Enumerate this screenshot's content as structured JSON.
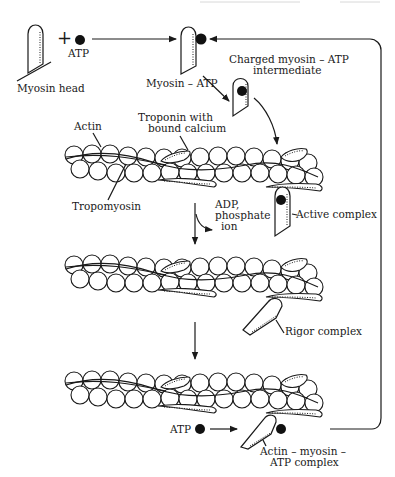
{
  "figure": {
    "colors": {
      "ink": "#1a1a1a",
      "background": "#ffffff",
      "atp_dot": "#111111"
    }
  },
  "labels": {
    "plus": "+",
    "atp_top": "ATP",
    "myosin_head": "Myosin head",
    "myosin_atp": "Myosin – ATP",
    "charged_line1": "Charged myosin – ATP",
    "charged_line2": "intermediate",
    "actin": "Actin",
    "troponin_line1": "Troponin with",
    "troponin_line2": "bound calcium",
    "tropomyosin": "Tropomyosin",
    "adp_line1": "ADP,",
    "adp_line2": "phosphate",
    "adp_line3": "ion",
    "active_complex": "Active complex",
    "rigor_complex": "Rigor complex",
    "atp_bottom": "ATP",
    "actin_myosin_line1": "Actin – myosin –",
    "actin_myosin_line2": "ATP complex"
  },
  "stages": [
    {
      "id": 1,
      "name": "Myosin head + ATP"
    },
    {
      "id": 2,
      "name": "Myosin – ATP"
    },
    {
      "id": 3,
      "name": "Charged myosin – ATP intermediate"
    },
    {
      "id": 4,
      "name": "Active complex"
    },
    {
      "id": 5,
      "name": "Rigor complex"
    },
    {
      "id": 6,
      "name": "Actin – myosin – ATP complex"
    }
  ]
}
